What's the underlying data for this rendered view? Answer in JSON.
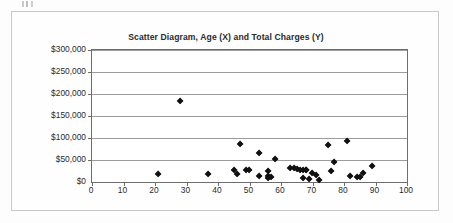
{
  "figure": {
    "title": "Scatter Diagram, Age (X) and Total Charges (Y)"
  },
  "chart_data": {
    "type": "scatter",
    "title": "Scatter Diagram, Age (X) and Total Charges (Y)",
    "xlabel": "",
    "ylabel": "",
    "xlim": [
      0,
      100
    ],
    "ylim": [
      0,
      300000
    ],
    "xticks": [
      0,
      10,
      20,
      30,
      40,
      50,
      60,
      70,
      80,
      90,
      100
    ],
    "xtick_labels": [
      "0",
      "10",
      "20",
      "30",
      "40",
      "50",
      "60",
      "70",
      "80",
      "90",
      "100"
    ],
    "yticks": [
      0,
      50000,
      100000,
      150000,
      200000,
      250000,
      300000
    ],
    "ytick_labels": [
      "$0",
      "$50,000",
      "$100,000",
      "$150,000",
      "$200,000",
      "$250,000",
      "$300,000"
    ],
    "grid": "horizontal",
    "legend": null,
    "marker": "diamond",
    "marker_color": "#111111",
    "series": [
      {
        "name": "Age vs Total Charges",
        "points": [
          [
            21,
            17000
          ],
          [
            28,
            183000
          ],
          [
            37,
            18000
          ],
          [
            45,
            26000
          ],
          [
            46,
            18000
          ],
          [
            47,
            86000
          ],
          [
            49,
            27000
          ],
          [
            50,
            28000
          ],
          [
            53,
            65000
          ],
          [
            53,
            13000
          ],
          [
            56,
            24000
          ],
          [
            56,
            13000
          ],
          [
            56,
            10000
          ],
          [
            57,
            11000
          ],
          [
            58,
            52000
          ],
          [
            63,
            31000
          ],
          [
            64,
            32000
          ],
          [
            65,
            29000
          ],
          [
            66,
            28000
          ],
          [
            67,
            27000
          ],
          [
            67,
            9000
          ],
          [
            68,
            28000
          ],
          [
            68,
            27000
          ],
          [
            69,
            6000
          ],
          [
            70,
            20000
          ],
          [
            71,
            16000
          ],
          [
            72,
            4000
          ],
          [
            75,
            85000
          ],
          [
            76,
            24000
          ],
          [
            77,
            45000
          ],
          [
            81,
            94000
          ],
          [
            82,
            14000
          ],
          [
            84,
            12000
          ],
          [
            85,
            12000
          ],
          [
            86,
            21000
          ],
          [
            89,
            37000
          ]
        ]
      }
    ]
  }
}
